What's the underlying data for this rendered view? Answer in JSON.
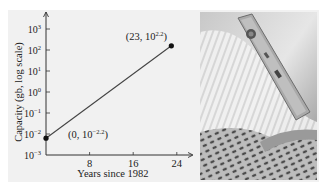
{
  "chart_data": {
    "type": "line",
    "title": "",
    "xlabel": "Years since 1982",
    "ylabel": "Capacity (gb, log scale)",
    "x_ticks": [
      8,
      16,
      24
    ],
    "y_ticks": [
      {
        "exp": "-3",
        "value": -3
      },
      {
        "exp": "-2",
        "value": -2
      },
      {
        "exp": "-1",
        "value": -1
      },
      {
        "exp": "0",
        "value": 0
      },
      {
        "exp": "1",
        "value": 1
      },
      {
        "exp": "2",
        "value": 2
      },
      {
        "exp": "3",
        "value": 3
      }
    ],
    "y_tick_base": "10",
    "xlim": [
      0,
      26
    ],
    "ylim_log10": [
      -3,
      3.8
    ],
    "yscale": "log",
    "grid": false,
    "series": [
      {
        "name": "capacity",
        "x": [
          0,
          23
        ],
        "log10_y": [
          -2.2,
          2.2
        ]
      }
    ],
    "annotations": [
      {
        "base": "(0, 10",
        "exp": "−2.2",
        "close": ")",
        "x": 0,
        "log10_y": -2.2
      },
      {
        "base": "(23, 10",
        "exp": "2.2",
        "close": ")",
        "x": 23,
        "log10_y": 2.2
      }
    ]
  },
  "photo": {
    "description": "photo of a portable hard-drive device on a perforated metal surface"
  }
}
